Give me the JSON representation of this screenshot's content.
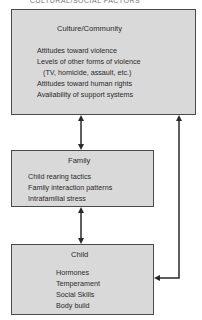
{
  "top_cutoff_text": "CULTURAL/SOCIAL FACTORS",
  "boxes": {
    "culture": {
      "title": "Culture/Community",
      "items": [
        "Attitudes toward violence",
        "Levels of other forms of violence",
        "(TV, homicide, assault, etc.)",
        "Attitudes toward human rights",
        "Availability of support systems"
      ]
    },
    "family": {
      "title": "Family",
      "items": [
        "Child rearing tactics",
        "Family interaction patterns",
        "Intrafamilial stress"
      ]
    },
    "child": {
      "title": "Child",
      "items": [
        "Hormones",
        "Temperament",
        "Social Skills",
        "Body build"
      ]
    }
  },
  "connectors": [
    {
      "from": "culture",
      "to": "family",
      "type": "bidirectional"
    },
    {
      "from": "family",
      "to": "child",
      "type": "bidirectional"
    },
    {
      "from": "child",
      "to": "culture",
      "type": "bidirectional"
    }
  ],
  "colors": {
    "box_fill": "#d9d9d9",
    "stroke": "#2a2a2a"
  }
}
